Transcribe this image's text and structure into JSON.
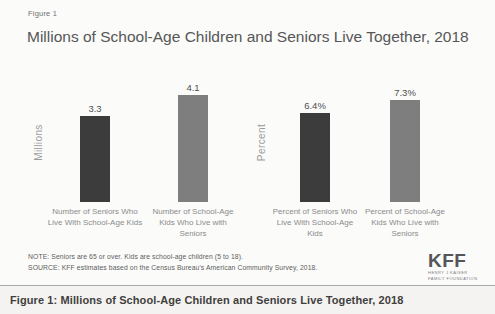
{
  "figure": {
    "figure_label": "Figure 1",
    "title": "Millions of School-Age Children and Seniors Live Together, 2018",
    "note": "NOTE: Seniors are 65 or over. Kids are school-age children (5 to 18).",
    "source": "SOURCE: KFF estimates based on the Census Bureau's American Community Survey, 2018.",
    "logo": {
      "text": "KFF",
      "sub_line1": "HENRY J KAISER",
      "sub_line2": "FAMILY FOUNDATION"
    }
  },
  "caption_bar": {
    "text": "Figure 1: Millions of School-Age Children and Seniors Live Together, 2018"
  },
  "colors": {
    "dark_bar": "#3c3c3c",
    "light_bar": "#7e7e7e",
    "title_text": "#565656",
    "axis_text": "#9b9b9b"
  },
  "chart_data": [
    {
      "type": "bar",
      "title": "",
      "ylabel": "Millions",
      "xlabel": "",
      "categories": [
        "Number of Seniors Who Live With School-Age Kids",
        "Number of School-Age Kids Who Live with Seniors"
      ],
      "values": [
        3.3,
        4.1
      ],
      "value_labels": [
        "3.3",
        "4.1"
      ],
      "bar_colors": [
        "#3c3c3c",
        "#7e7e7e"
      ],
      "ylim": [
        0,
        5
      ],
      "grid": false,
      "legend": "none"
    },
    {
      "type": "bar",
      "title": "",
      "ylabel": "Percent",
      "xlabel": "",
      "categories": [
        "Percent of Seniors Who Live With School-Age Kids",
        "Percent of School-Age Kids Who Live with Seniors"
      ],
      "values": [
        6.4,
        7.3
      ],
      "value_labels": [
        "6.4%",
        "7.3%"
      ],
      "bar_colors": [
        "#3c3c3c",
        "#7e7e7e"
      ],
      "ylim": [
        0,
        9.3
      ],
      "grid": false,
      "legend": "none"
    }
  ]
}
